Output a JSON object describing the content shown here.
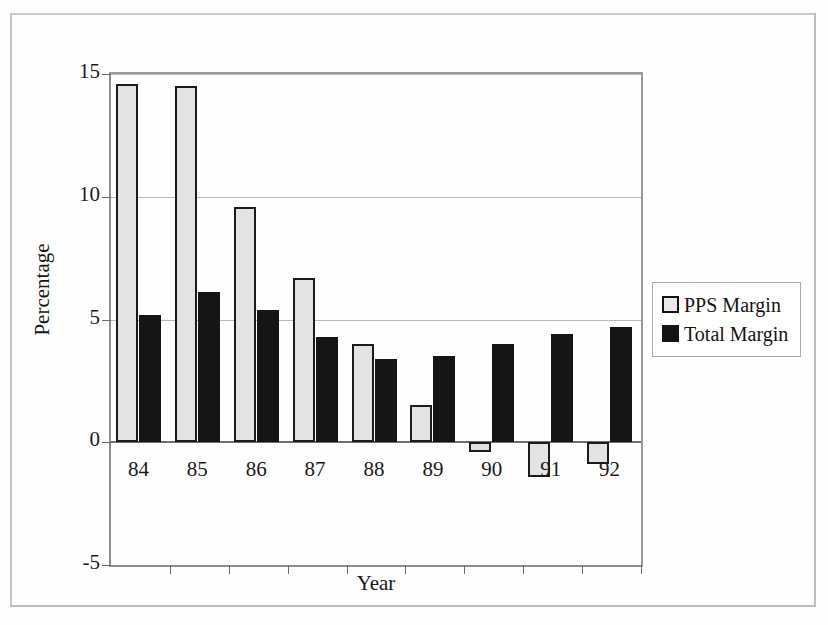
{
  "chart_data": {
    "type": "bar",
    "title": "",
    "xlabel": "Year",
    "ylabel": "Percentage",
    "categories": [
      "84",
      "85",
      "86",
      "87",
      "88",
      "89",
      "90",
      "91",
      "92"
    ],
    "series": [
      {
        "name": "PPS Margin",
        "color": "#e3e3e3",
        "values": [
          14.6,
          14.5,
          9.6,
          6.7,
          4.0,
          1.5,
          -0.4,
          -1.4,
          -0.9
        ]
      },
      {
        "name": "Total Margin",
        "color": "#151515",
        "values": [
          5.2,
          6.1,
          5.4,
          4.3,
          3.4,
          3.5,
          4.0,
          4.4,
          4.7
        ]
      }
    ],
    "ylim": [
      -5,
      15
    ],
    "yticks": [
      15,
      10,
      5,
      0,
      -5
    ],
    "ytick_labels": [
      "15",
      "10",
      "5",
      "0",
      "-5"
    ],
    "grid": true,
    "gridlines_at": [
      15,
      10,
      5,
      0
    ],
    "legend_position": "right",
    "legend_entries": [
      "PPS Margin",
      "Total Margin"
    ]
  },
  "axis": {
    "y_title": "Percentage",
    "x_title": "Year"
  },
  "legend": {
    "items": [
      {
        "label": "PPS Margin"
      },
      {
        "label": "Total Margin"
      }
    ]
  }
}
